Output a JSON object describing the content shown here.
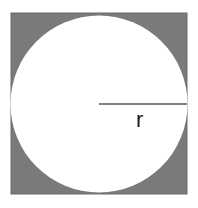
{
  "diagram": {
    "title": "",
    "shape": "circle inscribed in square",
    "square": {
      "x": 11,
      "y": 13,
      "size": 176,
      "fill": "#7a7a7a",
      "stroke": "#6a6a6a"
    },
    "circle": {
      "cx": 99,
      "cy": 104,
      "r": 88,
      "fill": "#ffffff"
    },
    "radius_line": {
      "x1": 99,
      "y1": 104,
      "x2": 187,
      "y2": 104,
      "stroke": "#555555"
    },
    "radius_label": {
      "text": "r",
      "x": 136,
      "y": 126
    }
  }
}
